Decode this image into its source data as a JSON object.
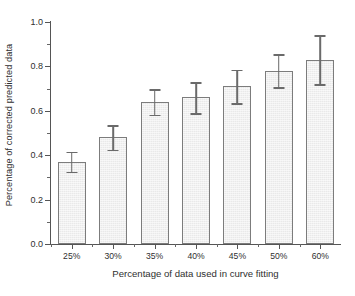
{
  "chart_data": {
    "type": "bar",
    "title": "",
    "xlabel": "Percentage of data used in curve fitting",
    "ylabel": "Percentage of corrected predicted data",
    "categories": [
      "25%",
      "30%",
      "35%",
      "40%",
      "45%",
      "50%",
      "60%"
    ],
    "values": [
      0.37,
      0.48,
      0.64,
      0.66,
      0.71,
      0.78,
      0.83
    ],
    "errors": [
      0.045,
      0.055,
      0.058,
      0.07,
      0.075,
      0.075,
      0.11
    ],
    "series": [
      {
        "name": "Percentage of corrected predicted data",
        "values": [
          0.37,
          0.48,
          0.64,
          0.66,
          0.71,
          0.78,
          0.83
        ],
        "errors": [
          0.045,
          0.055,
          0.058,
          0.07,
          0.075,
          0.075,
          0.11
        ]
      }
    ],
    "ylim": [
      0.0,
      1.0
    ],
    "ytick_labels": [
      "0.0",
      "0.2",
      "0.4",
      "0.6",
      "0.8",
      "1.0"
    ],
    "ytick_values": [
      0.0,
      0.2,
      0.4,
      0.6,
      0.8,
      1.0
    ],
    "yminor_values": [
      0.1,
      0.3,
      0.5,
      0.7,
      0.9
    ],
    "xtick_labels": [
      "25%",
      "30%",
      "35%",
      "40%",
      "45%",
      "50%",
      "60%"
    ],
    "grid": false,
    "legend": null,
    "legend_position": "none",
    "bar_facecolor": "#e9e9e9",
    "bar_edgecolor": "#7c7c7c",
    "error_color": "#6a6a6a",
    "axis_color": "#555555",
    "background": "#ffffff",
    "errorbar_style": "symmetric-caps",
    "annotations": []
  }
}
